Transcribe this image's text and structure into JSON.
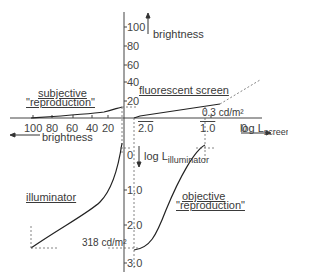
{
  "diagram": {
    "axes": {
      "brightness_up_label": "brightness",
      "brightness_left_label": "brightness",
      "log_screen_label": "log L",
      "log_screen_sub": "screen",
      "log_illuminator_label": "log L",
      "log_illuminator_sub": "illuminator"
    },
    "ticks": {
      "brightness_vertical": [
        "100",
        "80",
        "60",
        "40",
        "20"
      ],
      "brightness_horizontal": [
        "100",
        "80",
        "60",
        "40",
        "20"
      ],
      "log_screen": [
        "2.0",
        "1.0",
        "0"
      ],
      "log_illuminator": [
        "0",
        "1.0",
        "2.0",
        "3.0"
      ]
    },
    "curve_labels": {
      "subjective_line1": "subjective",
      "subjective_line2": "\"reproduction\"",
      "fluorescent": "fluorescent  screen",
      "illuminator": "illuminator",
      "objective_line1": "objective",
      "objective_line2": "\"reproduction\""
    },
    "annotations": {
      "screen_luminance": "0.3 cd/m²",
      "illuminator_luminance": "318 cd/m²"
    }
  }
}
